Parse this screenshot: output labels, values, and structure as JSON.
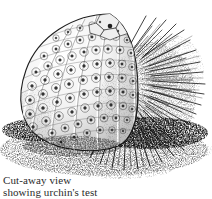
{
  "figure": {
    "medium": "pen-and-ink stipple and line illustration",
    "caption_lines": [
      "Cut-away view",
      "showing urchin's test"
    ],
    "caption_line_1": "Cut-away view",
    "caption_line_2": "showing urchin's test",
    "background_color": "#ffffff",
    "ink_color": "#1d1d1d",
    "midtone_color": "#6b6b6b",
    "light_tone_color": "#b4b4b4",
    "shadow_color": "#3a3a3a"
  },
  "anatomy": {
    "test_label": "test",
    "spines_label": "spines",
    "apical_system_label": "apical system",
    "tubercle_label": "tubercle",
    "plate_column_label": "plate column",
    "substrate_label": "sea floor"
  },
  "structure": {
    "test_plate_columns": 7,
    "tubercle_rows_per_column": 9,
    "spine_count": 120,
    "long_ventral_spine_count": 9,
    "apical_plate_count": 9
  },
  "geometry": {
    "body_center_x": 110,
    "body_center_y": 92,
    "body_radius_x": 96,
    "body_radius_y": 78,
    "ground_line_y": 150
  }
}
